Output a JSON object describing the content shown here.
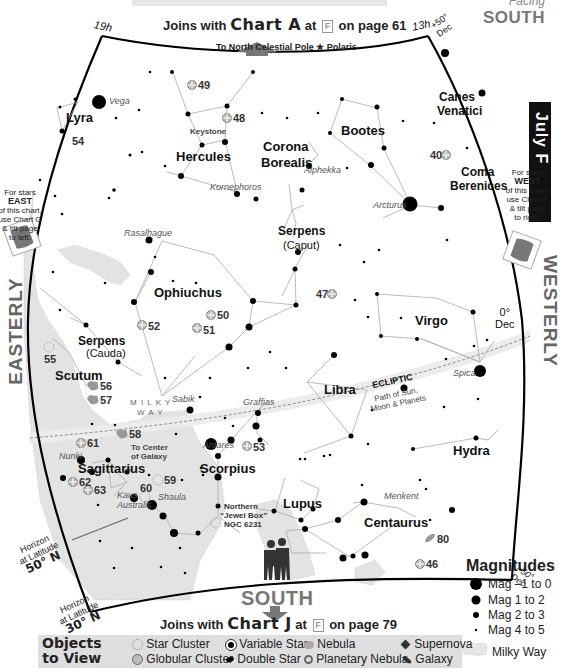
{
  "header": {
    "facing_small": "Facing",
    "facing_big": "SOUTH",
    "joins_top": {
      "prefix": "Joins with",
      "chart": "Chart A",
      "at": "at",
      "key": "F",
      "suffix": "on page 61"
    },
    "polaris_note": "To North Celestial Pole ★ Polaris"
  },
  "month_tab": {
    "label": "July  F"
  },
  "coords": {
    "ra_left": "19h",
    "ra_right": "13h",
    "dec_top": "+50° Dec",
    "dec_mid_value": "0°",
    "dec_mid_unit": "Dec",
    "dec_bottom": "–50° Dec"
  },
  "side_notes": {
    "east": {
      "line1": "For stars",
      "bold": "EAST",
      "line2": "of this chart,",
      "line3": "use Chart G",
      "line4": "& tilt page",
      "line5": "to left."
    },
    "west": {
      "line1": "For stars",
      "bold": "WEST",
      "line2": "of this chart,",
      "line3": "use Chart E",
      "line4": "& tilt page",
      "line5": "to right."
    },
    "easterly": "EASTERLY",
    "westerly": "WESTERLY"
  },
  "constellations": [
    {
      "name": "Lyra",
      "x": 66,
      "y": 117
    },
    {
      "name": "Hercules",
      "x": 176,
      "y": 156
    },
    {
      "name": "Corona",
      "x": 263,
      "y": 146
    },
    {
      "name": "Borealis",
      "x": 261,
      "y": 162
    },
    {
      "name": "Bootes",
      "x": 341,
      "y": 130
    },
    {
      "name": "Canes",
      "x": 439,
      "y": 97
    },
    {
      "name": "Venatici",
      "x": 437,
      "y": 112
    },
    {
      "name": "Coma",
      "x": 461,
      "y": 172
    },
    {
      "name": "Berenices",
      "x": 450,
      "y": 187
    },
    {
      "name": "Serpens",
      "x": 278,
      "y": 232
    },
    {
      "name": "Ophiuchus",
      "x": 154,
      "y": 293
    },
    {
      "name": "Serpens",
      "x": 78,
      "y": 341
    },
    {
      "name": "Virgo",
      "x": 415,
      "y": 321
    },
    {
      "name": "Scutum",
      "x": 55,
      "y": 375
    },
    {
      "name": "Libra",
      "x": 324,
      "y": 389
    },
    {
      "name": "Hydra",
      "x": 453,
      "y": 451
    },
    {
      "name": "Sagittarius",
      "x": 78,
      "y": 468
    },
    {
      "name": "Scorpius",
      "x": 200,
      "y": 468
    },
    {
      "name": "Lupus",
      "x": 283,
      "y": 503
    },
    {
      "name": "Centaurus",
      "x": 364,
      "y": 522
    }
  ],
  "sub_labels": [
    {
      "text": "(Caput)",
      "x": 283,
      "y": 246
    },
    {
      "text": "(Cauda)",
      "x": 86,
      "y": 354
    }
  ],
  "star_names": [
    {
      "text": "Vega",
      "x": 109,
      "y": 102
    },
    {
      "text": "Kornephoros",
      "x": 210,
      "y": 188
    },
    {
      "text": "Alphekka",
      "x": 304,
      "y": 171
    },
    {
      "text": "Arcturus",
      "x": 373,
      "y": 206
    },
    {
      "text": "Rasalhague",
      "x": 124,
      "y": 234
    },
    {
      "text": "Sabik",
      "x": 172,
      "y": 400
    },
    {
      "text": "Graffias",
      "x": 243,
      "y": 403
    },
    {
      "text": "Spica",
      "x": 453,
      "y": 374
    },
    {
      "text": "Antares",
      "x": 203,
      "y": 446
    },
    {
      "text": "Nunki",
      "x": 59,
      "y": 457
    },
    {
      "text": "Kaus",
      "x": 117,
      "y": 496
    },
    {
      "text": "Australis",
      "x": 117,
      "y": 507
    },
    {
      "text": "Shaula",
      "x": 158,
      "y": 498
    },
    {
      "text": "Menkent",
      "x": 384,
      "y": 497
    }
  ],
  "annotations": {
    "keystone": "Keystone",
    "milky_way_1": "M I L K Y",
    "milky_way_2": "W A Y",
    "center_galaxy_1": "To Center",
    "center_galaxy_2": "of Galaxy",
    "jewel_1": "Northern",
    "jewel_2": "“Jewel Box”",
    "jewel_3": "NGC 6231",
    "ecliptic": "ECLIPTIC",
    "ecliptic_sub_1": "Path of Sun,",
    "ecliptic_sub_2": "Moon & Planets"
  },
  "objects": [
    {
      "id": "49",
      "type": "globular",
      "x": 192,
      "y": 85
    },
    {
      "id": "48",
      "type": "globular",
      "x": 227,
      "y": 118
    },
    {
      "id": "40",
      "type": "globular",
      "x": 446,
      "y": 155
    },
    {
      "id": "54",
      "type": "double",
      "x": 69,
      "y": 138
    },
    {
      "id": "47",
      "type": "globular",
      "x": 332,
      "y": 294
    },
    {
      "id": "50",
      "type": "globular",
      "x": 211,
      "y": 315
    },
    {
      "id": "51",
      "type": "globular",
      "x": 197,
      "y": 328
    },
    {
      "id": "52",
      "type": "globular",
      "x": 142,
      "y": 325
    },
    {
      "id": "55",
      "type": "globular",
      "x": 49,
      "y": 347
    },
    {
      "id": "56",
      "type": "nebula",
      "x": 93,
      "y": 386
    },
    {
      "id": "57",
      "type": "nebula",
      "x": 93,
      "y": 399
    },
    {
      "id": "58",
      "type": "nebula",
      "x": 122,
      "y": 434
    },
    {
      "id": "61",
      "type": "globular",
      "x": 81,
      "y": 443
    },
    {
      "id": "62",
      "type": "globular",
      "x": 73,
      "y": 482
    },
    {
      "id": "63",
      "type": "globular",
      "x": 88,
      "y": 490
    },
    {
      "id": "59",
      "type": "cluster",
      "x": 158,
      "y": 480
    },
    {
      "id": "60",
      "type": "cluster",
      "x": 145,
      "y": 494
    },
    {
      "id": "53",
      "type": "globular",
      "x": 247,
      "y": 446
    },
    {
      "id": "80",
      "type": "galaxy",
      "x": 430,
      "y": 538
    },
    {
      "id": "46",
      "type": "globular",
      "x": 420,
      "y": 564
    }
  ],
  "horizons": [
    {
      "line1": "Horizon",
      "line2": "at Latitude",
      "lat": "50° N"
    },
    {
      "line1": "Horizon",
      "line2": "at Latitude",
      "lat": "30° N"
    }
  ],
  "footer": {
    "south": "SOUTH",
    "joins_bottom": {
      "prefix": "Joins with",
      "chart": "Chart J",
      "at": "at",
      "key": "F",
      "suffix": "on page 79"
    }
  },
  "legend": {
    "title_1": "Objects",
    "title_2": "to View",
    "items": [
      {
        "icon": "star-cluster",
        "label": "Star Cluster"
      },
      {
        "icon": "globular-cluster",
        "label": "Globular Cluster"
      },
      {
        "icon": "variable-star",
        "label": "Variable Star"
      },
      {
        "icon": "double-star",
        "label": "Double Star"
      },
      {
        "icon": "nebula",
        "label": "Nebula"
      },
      {
        "icon": "planetary-nebula",
        "label": "Planetary Nebula"
      },
      {
        "icon": "supernova",
        "label": "Supernova"
      },
      {
        "icon": "galaxy",
        "label": "Galaxy"
      }
    ]
  },
  "magnitudes": {
    "title": "Magnitudes",
    "items": [
      {
        "label": "Mag –1 to 0",
        "r": 6
      },
      {
        "label": "Mag 1 to 2",
        "r": 4.5
      },
      {
        "label": "Mag 2 to 3",
        "r": 3
      },
      {
        "label": "Mag 4 to 5",
        "r": 1
      }
    ],
    "milky_way": "Milky Way"
  },
  "colors": {
    "milky_way": "#e2e2e2",
    "line": "#aaaaaa",
    "border": "#000000",
    "label_gray": "#777777",
    "legend_bg": "#dedede"
  }
}
